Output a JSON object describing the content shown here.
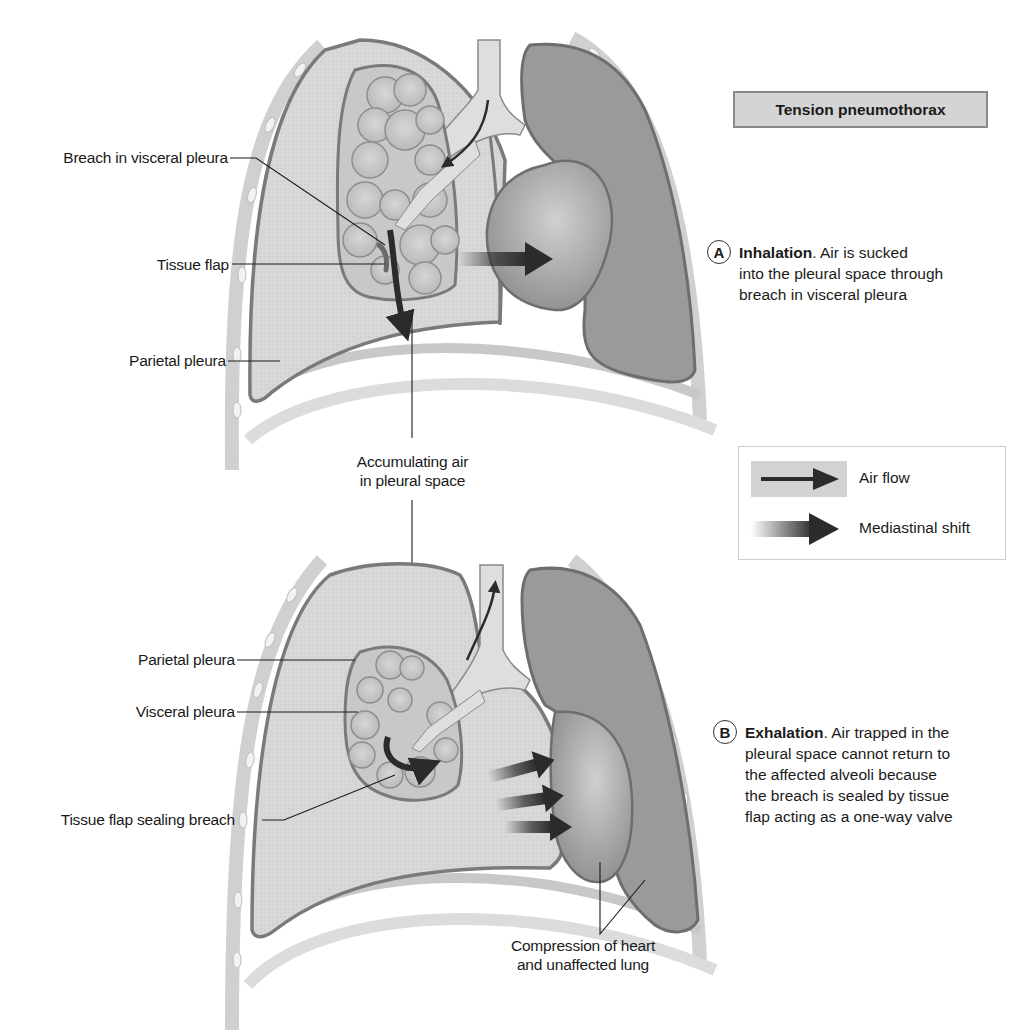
{
  "title": "Tension pneumothorax",
  "colors": {
    "pleural_air": "#d9d9d9",
    "lung_tissue": "#c4c4c4",
    "collapsed_lung_outline": "#7a7a7a",
    "unaffected_lung": "#9a9a9a",
    "heart": "#a6a6a6",
    "ribcage": "#cfcfcf",
    "arrow": "#2b2b2b",
    "title_box_bg": "#d4d4d4"
  },
  "panel_a": {
    "badge": "A",
    "heading": "Inhalation",
    "lines": [
      ". Air is sucked",
      "into the pleural space through",
      "breach in visceral pleura"
    ],
    "labels": {
      "breach": "Breach in visceral pleura",
      "tissue_flap": "Tissue flap",
      "parietal_pleura": "Parietal pleura"
    }
  },
  "shared_label": {
    "line1": "Accumulating air",
    "line2": "in pleural space"
  },
  "legend": {
    "items": [
      {
        "icon": "air-flow-arrow",
        "label": "Air flow"
      },
      {
        "icon": "mediastinal-shift-arrow",
        "label": "Mediastinal shift"
      }
    ]
  },
  "panel_b": {
    "badge": "B",
    "heading": "Exhalation",
    "lines": [
      ". Air trapped in the",
      "pleural space cannot return to",
      "the affected alveoli because",
      "the breach is sealed by tissue",
      "flap acting as a one-way valve"
    ],
    "labels": {
      "parietal_pleura": "Parietal pleura",
      "visceral_pleura": "Visceral pleura",
      "tissue_flap_sealing": "Tissue flap sealing breach",
      "compression_line1": "Compression of heart",
      "compression_line2": "and unaffected lung"
    }
  }
}
